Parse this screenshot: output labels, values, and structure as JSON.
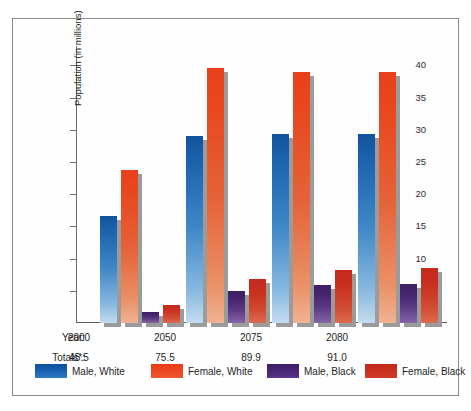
{
  "chart_data": {
    "type": "bar",
    "title": "",
    "xlabel": "Year",
    "ylabel": "Population (in millions)",
    "ylim": [
      0,
      43
    ],
    "yticks": [
      5,
      10,
      15,
      20,
      25,
      30,
      35,
      40
    ],
    "ytick_labels": [
      "5",
      "10",
      "15",
      "20",
      "25",
      "30",
      "35",
      "40"
    ],
    "grid": false,
    "legend_position": "bottom",
    "categories": [
      "2000",
      "2050",
      "2075",
      "2080"
    ],
    "series": [
      {
        "name": "Male, White",
        "color": "#1557a5",
        "values": [
          16.6,
          29.0,
          29.3,
          29.4
        ]
      },
      {
        "name": "Female, White",
        "color": "#e8401c",
        "values": [
          23.7,
          39.6,
          39.0,
          38.9
        ]
      },
      {
        "name": "Male, Black",
        "color": "#4a2470",
        "values": [
          1.7,
          4.9,
          5.9,
          6.0
        ]
      },
      {
        "name": "Female, Black",
        "color": "#c42a1e",
        "values": [
          2.8,
          6.8,
          8.2,
          8.5
        ]
      }
    ],
    "annotations": {
      "year_row_label": "Year:",
      "totals_row_label": "Totals*:",
      "totals": [
        "45.5",
        "75.5",
        "89.9",
        "91.0"
      ]
    }
  },
  "axis": {
    "y_title": "Population (in millions)",
    "ticks": [
      "40",
      "35",
      "30",
      "25",
      "20",
      "15",
      "10",
      "5"
    ]
  },
  "table": {
    "year_label": "Year:",
    "totals_label": "Totals*:",
    "years": [
      "2000",
      "2050",
      "2075",
      "2080"
    ],
    "totals": [
      "45.5",
      "75.5",
      "89.9",
      "91.0"
    ]
  },
  "legend": {
    "items": [
      {
        "label": "Male, White"
      },
      {
        "label": "Female, White"
      },
      {
        "label": "Male, Black"
      },
      {
        "label": "Female, Black"
      }
    ]
  }
}
